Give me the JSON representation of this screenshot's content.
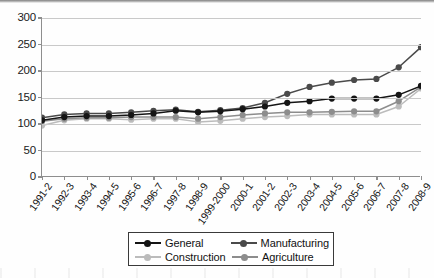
{
  "chart_data": {
    "type": "line",
    "title": "",
    "xlabel": "",
    "ylabel": "",
    "ylim": [
      0,
      300
    ],
    "ytick_step": 50,
    "yticks": [
      0,
      50,
      100,
      150,
      200,
      250,
      300
    ],
    "grid": true,
    "legend_position": "bottom-center",
    "categories": [
      "1991-2",
      "1992-3",
      "1993-4",
      "1994-5",
      "1995-6",
      "1996-7",
      "1997-8",
      "1998-9",
      "1999-2000",
      "2000-1",
      "2001-2",
      "2002-3",
      "2003-4",
      "2004-5",
      "2005-6",
      "2006-7",
      "2007-8",
      "2008-9"
    ],
    "series": [
      {
        "name": "General",
        "color": "#151515",
        "values": [
          107,
          113,
          115,
          115,
          117,
          120,
          125,
          122,
          124,
          128,
          133,
          140,
          143,
          148,
          148,
          148,
          155,
          172
        ]
      },
      {
        "name": "Manufacturing",
        "color": "#4a4a4a",
        "values": [
          112,
          118,
          120,
          120,
          122,
          125,
          127,
          123,
          126,
          130,
          140,
          157,
          170,
          178,
          183,
          185,
          207,
          245
        ]
      },
      {
        "name": "Construction",
        "color": "#bcbcbc",
        "values": [
          97,
          107,
          110,
          110,
          108,
          110,
          110,
          104,
          106,
          110,
          113,
          115,
          118,
          118,
          118,
          118,
          133,
          167
        ]
      },
      {
        "name": "Agriculture",
        "color": "#8d8d8d",
        "values": [
          105,
          110,
          112,
          112,
          113,
          113,
          113,
          110,
          113,
          117,
          120,
          122,
          122,
          123,
          124,
          124,
          143,
          170
        ]
      }
    ]
  },
  "legend": {
    "entries": [
      {
        "label": "General",
        "color": "#151515"
      },
      {
        "label": "Manufacturing",
        "color": "#4a4a4a"
      },
      {
        "label": "Construction",
        "color": "#bcbcbc"
      },
      {
        "label": "Agriculture",
        "color": "#8d8d8d"
      }
    ]
  }
}
